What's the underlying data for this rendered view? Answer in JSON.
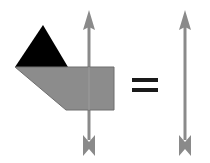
{
  "diagram": {
    "description": "Shape with arrow equals arrow",
    "colors": {
      "background": "#ffffff",
      "triangle": "#000000",
      "polygon": "#8c8c8c",
      "polygon_stroke": "#6e6e6e",
      "arrow": "#8a8a8a",
      "equals": "#1a1a1a"
    },
    "left_group": {
      "triangle_label": "black-triangle",
      "polygon_label": "grey-pentagon",
      "arrow_label": "vertical-arrow-up"
    },
    "operator": "=",
    "right_group": {
      "arrow_label": "vertical-arrow-up"
    }
  }
}
